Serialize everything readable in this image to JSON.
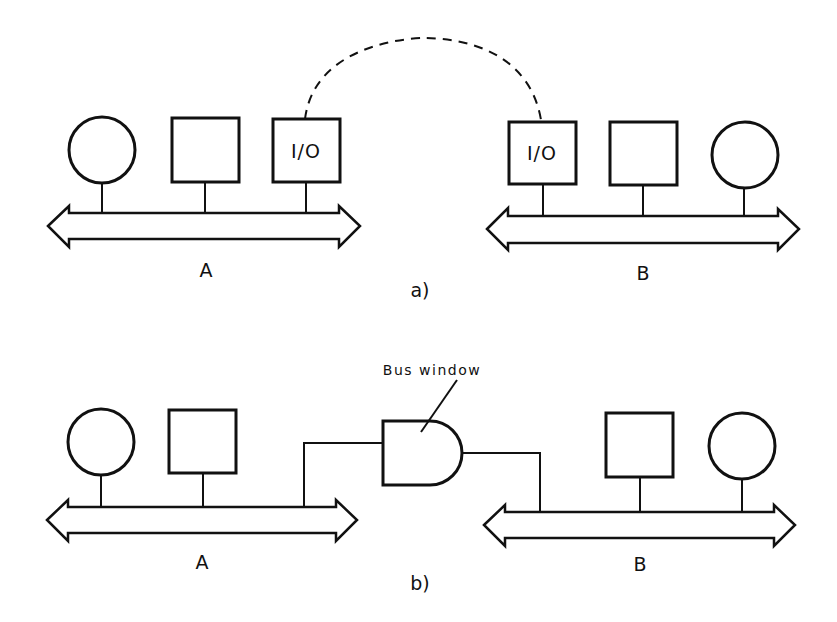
{
  "figure": {
    "panel_a": {
      "caption": "a)",
      "bus_a": {
        "label": "A",
        "devices": [
          "circle",
          "square",
          "I/O"
        ]
      },
      "bus_b": {
        "label": "B",
        "devices": [
          "I/O",
          "square",
          "circle"
        ]
      },
      "io_label_left": "I/O",
      "io_label_right": "I/O",
      "link": "dashed connection between I/O units"
    },
    "panel_b": {
      "caption": "b)",
      "bus_a": {
        "label": "A",
        "devices": [
          "circle",
          "square"
        ]
      },
      "bus_b": {
        "label": "B",
        "devices": [
          "square",
          "circle"
        ]
      },
      "bridge_label": "Bus window"
    }
  }
}
